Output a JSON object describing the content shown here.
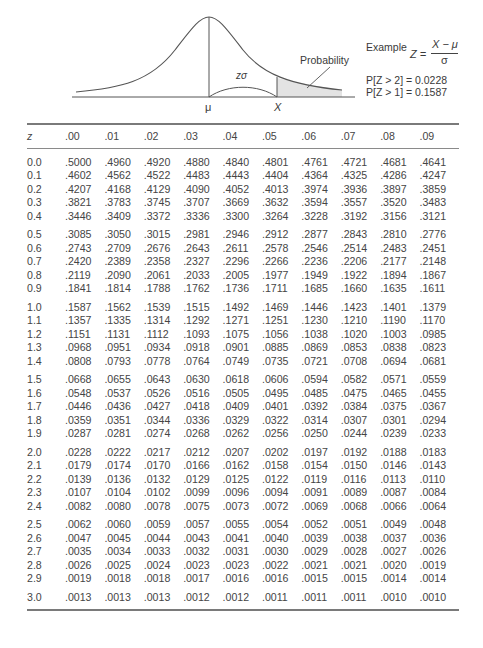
{
  "diagram": {
    "labels": {
      "mu": "μ",
      "x": "X",
      "z_sigma": "zσ",
      "probability": "Probability"
    },
    "example": {
      "title": "Example",
      "formula_lhs": "Z =",
      "formula_numerator": "X − μ",
      "formula_denominator": "σ",
      "line1": "P[Z > 2] = 0.0228",
      "line2": "P[Z > 1] = 0.1587"
    },
    "colors": {
      "line": "#555555",
      "shade": "#e3e3e3"
    }
  },
  "table": {
    "header": [
      "z",
      ".00",
      ".01",
      ".02",
      ".03",
      ".04",
      ".05",
      ".06",
      ".07",
      ".08",
      ".09"
    ],
    "rows": [
      [
        "0.0",
        ".5000",
        ".4960",
        ".4920",
        ".4880",
        ".4840",
        ".4801",
        ".4761",
        ".4721",
        ".4681",
        ".4641"
      ],
      [
        "0.1",
        ".4602",
        ".4562",
        ".4522",
        ".4483",
        ".4443",
        ".4404",
        ".4364",
        ".4325",
        ".4286",
        ".4247"
      ],
      [
        "0.2",
        ".4207",
        ".4168",
        ".4129",
        ".4090",
        ".4052",
        ".4013",
        ".3974",
        ".3936",
        ".3897",
        ".3859"
      ],
      [
        "0.3",
        ".3821",
        ".3783",
        ".3745",
        ".3707",
        ".3669",
        ".3632",
        ".3594",
        ".3557",
        ".3520",
        ".3483"
      ],
      [
        "0.4",
        ".3446",
        ".3409",
        ".3372",
        ".3336",
        ".3300",
        ".3264",
        ".3228",
        ".3192",
        ".3156",
        ".3121"
      ],
      [
        "0.5",
        ".3085",
        ".3050",
        ".3015",
        ".2981",
        ".2946",
        ".2912",
        ".2877",
        ".2843",
        ".2810",
        ".2776"
      ],
      [
        "0.6",
        ".2743",
        ".2709",
        ".2676",
        ".2643",
        ".2611",
        ".2578",
        ".2546",
        ".2514",
        ".2483",
        ".2451"
      ],
      [
        "0.7",
        ".2420",
        ".2389",
        ".2358",
        ".2327",
        ".2296",
        ".2266",
        ".2236",
        ".2206",
        ".2177",
        ".2148"
      ],
      [
        "0.8",
        ".2119",
        ".2090",
        ".2061",
        ".2033",
        ".2005",
        ".1977",
        ".1949",
        ".1922",
        ".1894",
        ".1867"
      ],
      [
        "0.9",
        ".1841",
        ".1814",
        ".1788",
        ".1762",
        ".1736",
        ".1711",
        ".1685",
        ".1660",
        ".1635",
        ".1611"
      ],
      [
        "1.0",
        ".1587",
        ".1562",
        ".1539",
        ".1515",
        ".1492",
        ".1469",
        ".1446",
        ".1423",
        ".1401",
        ".1379"
      ],
      [
        "1.1",
        ".1357",
        ".1335",
        ".1314",
        ".1292",
        ".1271",
        ".1251",
        ".1230",
        ".1210",
        ".1190",
        ".1170"
      ],
      [
        "1.2",
        ".1151",
        ".1131",
        ".1112",
        ".1093",
        ".1075",
        ".1056",
        ".1038",
        ".1020",
        ".1003",
        ".0985"
      ],
      [
        "1.3",
        ".0968",
        ".0951",
        ".0934",
        ".0918",
        ".0901",
        ".0885",
        ".0869",
        ".0853",
        ".0838",
        ".0823"
      ],
      [
        "1.4",
        ".0808",
        ".0793",
        ".0778",
        ".0764",
        ".0749",
        ".0735",
        ".0721",
        ".0708",
        ".0694",
        ".0681"
      ],
      [
        "1.5",
        ".0668",
        ".0655",
        ".0643",
        ".0630",
        ".0618",
        ".0606",
        ".0594",
        ".0582",
        ".0571",
        ".0559"
      ],
      [
        "1.6",
        ".0548",
        ".0537",
        ".0526",
        ".0516",
        ".0505",
        ".0495",
        ".0485",
        ".0475",
        ".0465",
        ".0455"
      ],
      [
        "1.7",
        ".0446",
        ".0436",
        ".0427",
        ".0418",
        ".0409",
        ".0401",
        ".0392",
        ".0384",
        ".0375",
        ".0367"
      ],
      [
        "1.8",
        ".0359",
        ".0351",
        ".0344",
        ".0336",
        ".0329",
        ".0322",
        ".0314",
        ".0307",
        ".0301",
        ".0294"
      ],
      [
        "1.9",
        ".0287",
        ".0281",
        ".0274",
        ".0268",
        ".0262",
        ".0256",
        ".0250",
        ".0244",
        ".0239",
        ".0233"
      ],
      [
        "2.0",
        ".0228",
        ".0222",
        ".0217",
        ".0212",
        ".0207",
        ".0202",
        ".0197",
        ".0192",
        ".0188",
        ".0183"
      ],
      [
        "2.1",
        ".0179",
        ".0174",
        ".0170",
        ".0166",
        ".0162",
        ".0158",
        ".0154",
        ".0150",
        ".0146",
        ".0143"
      ],
      [
        "2.2",
        ".0139",
        ".0136",
        ".0132",
        ".0129",
        ".0125",
        ".0122",
        ".0119",
        ".0116",
        ".0113",
        ".0110"
      ],
      [
        "2.3",
        ".0107",
        ".0104",
        ".0102",
        ".0099",
        ".0096",
        ".0094",
        ".0091",
        ".0089",
        ".0087",
        ".0084"
      ],
      [
        "2.4",
        ".0082",
        ".0080",
        ".0078",
        ".0075",
        ".0073",
        ".0072",
        ".0069",
        ".0068",
        ".0066",
        ".0064"
      ],
      [
        "2.5",
        ".0062",
        ".0060",
        ".0059",
        ".0057",
        ".0055",
        ".0054",
        ".0052",
        ".0051",
        ".0049",
        ".0048"
      ],
      [
        "2.6",
        ".0047",
        ".0045",
        ".0044",
        ".0043",
        ".0041",
        ".0040",
        ".0039",
        ".0038",
        ".0037",
        ".0036"
      ],
      [
        "2.7",
        ".0035",
        ".0034",
        ".0033",
        ".0032",
        ".0031",
        ".0030",
        ".0029",
        ".0028",
        ".0027",
        ".0026"
      ],
      [
        "2.8",
        ".0026",
        ".0025",
        ".0024",
        ".0023",
        ".0023",
        ".0022",
        ".0021",
        ".0021",
        ".0020",
        ".0019"
      ],
      [
        "2.9",
        ".0019",
        ".0018",
        ".0018",
        ".0017",
        ".0016",
        ".0016",
        ".0015",
        ".0015",
        ".0014",
        ".0014"
      ],
      [
        "3.0",
        ".0013",
        ".0013",
        ".0013",
        ".0012",
        ".0012",
        ".0011",
        ".0011",
        ".0011",
        ".0010",
        ".0010"
      ]
    ]
  }
}
